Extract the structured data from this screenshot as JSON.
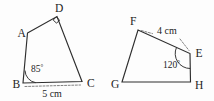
{
  "figure": {
    "background_color": "#fdfdfd",
    "stroke_color": "#2e2e2e",
    "dash_color": "#6a6a6a",
    "shapes": [
      {
        "id": "quadrilateral-abcd",
        "vertices": [
          {
            "label": "A",
            "x": 27.5,
            "y": 33.0,
            "label_x": 17.5,
            "label_y": 36.5
          },
          {
            "label": "D",
            "x": 57.0,
            "y": 16.5,
            "label_x": 55.0,
            "label_y": 12.0
          },
          {
            "label": "C",
            "x": 82.0,
            "y": 81.5,
            "label_x": 87.0,
            "label_y": 86.5
          },
          {
            "label": "B",
            "x": 23.0,
            "y": 83.0,
            "label_x": 12.5,
            "label_y": 88.0
          }
        ],
        "angles": [
          {
            "at": "B",
            "value": "85",
            "unit": "°",
            "label_x": 31.0,
            "label_y": 72.0,
            "type": "arc"
          },
          {
            "at": "D",
            "value": "90",
            "unit": "°",
            "type": "right-angle-square"
          }
        ],
        "measures": [
          {
            "label": "5 cm",
            "from": "B",
            "to": "C",
            "style": "dashed",
            "label_x": 52.0,
            "label_y": 97.0
          }
        ]
      },
      {
        "id": "quadrilateral-efgh",
        "vertices": [
          {
            "label": "F",
            "x": 138.0,
            "y": 30.0,
            "label_x": 130.0,
            "label_y": 25.0
          },
          {
            "label": "E",
            "x": 190.0,
            "y": 53.5,
            "label_x": 195.5,
            "label_y": 57.0
          },
          {
            "label": "H",
            "x": 190.5,
            "y": 82.0,
            "label_x": 195.0,
            "label_y": 89.0
          },
          {
            "label": "G",
            "x": 122.0,
            "y": 82.0,
            "label_x": 111.0,
            "label_y": 88.0
          }
        ],
        "angles": [
          {
            "at": "E",
            "value": "120",
            "unit": "°",
            "label_x": 163.0,
            "label_y": 68.0,
            "type": "arc"
          }
        ],
        "measures": [
          {
            "label": "4 cm",
            "from": "F",
            "to": "E",
            "style": "dashed",
            "label_x": 157.0,
            "label_y": 34.0
          }
        ]
      }
    ]
  }
}
